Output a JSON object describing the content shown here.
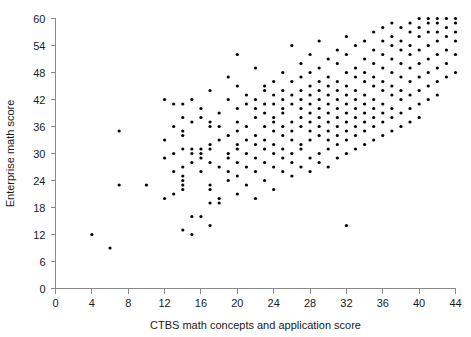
{
  "chart_data": {
    "type": "scatter",
    "title": "",
    "xlabel": "CTBS math concepts and application score",
    "ylabel": "Enterprise math score",
    "xlim": [
      0,
      44
    ],
    "ylim": [
      0,
      60
    ],
    "xticks": [
      0,
      4,
      8,
      12,
      16,
      20,
      24,
      28,
      32,
      36,
      40,
      44
    ],
    "yticks": [
      0,
      6,
      12,
      18,
      24,
      30,
      36,
      42,
      48,
      54,
      60
    ],
    "grid": false,
    "legend": null,
    "marker": {
      "shape": "circle",
      "color": "#000000",
      "size": 3.2
    },
    "points": [
      [
        4,
        12
      ],
      [
        6,
        9
      ],
      [
        7,
        23
      ],
      [
        7,
        35
      ],
      [
        10,
        23
      ],
      [
        12,
        20
      ],
      [
        12,
        42
      ],
      [
        12,
        29
      ],
      [
        12,
        33
      ],
      [
        13,
        21
      ],
      [
        13,
        36
      ],
      [
        13,
        41
      ],
      [
        13,
        30
      ],
      [
        13,
        26
      ],
      [
        14,
        13
      ],
      [
        14,
        22
      ],
      [
        14,
        23
      ],
      [
        14,
        24
      ],
      [
        14,
        25
      ],
      [
        14,
        27
      ],
      [
        14,
        31
      ],
      [
        14,
        34
      ],
      [
        14,
        35
      ],
      [
        14,
        38
      ],
      [
        14,
        41
      ],
      [
        15,
        12
      ],
      [
        15,
        16
      ],
      [
        15,
        28
      ],
      [
        15,
        30
      ],
      [
        15,
        31
      ],
      [
        15,
        37
      ],
      [
        15,
        42
      ],
      [
        16,
        16
      ],
      [
        16,
        26
      ],
      [
        16,
        29
      ],
      [
        16,
        30
      ],
      [
        16,
        31
      ],
      [
        16,
        38
      ],
      [
        16,
        40
      ],
      [
        17,
        14
      ],
      [
        17,
        19
      ],
      [
        17,
        22
      ],
      [
        17,
        23
      ],
      [
        17,
        28
      ],
      [
        17,
        31
      ],
      [
        17,
        32
      ],
      [
        17,
        36
      ],
      [
        17,
        37
      ],
      [
        17,
        44
      ],
      [
        18,
        19
      ],
      [
        18,
        20
      ],
      [
        18,
        27
      ],
      [
        18,
        33
      ],
      [
        18,
        36
      ],
      [
        18,
        39
      ],
      [
        19,
        24
      ],
      [
        19,
        26
      ],
      [
        19,
        29
      ],
      [
        19,
        30
      ],
      [
        19,
        34
      ],
      [
        19,
        42
      ],
      [
        19,
        47
      ],
      [
        20,
        21
      ],
      [
        20,
        25
      ],
      [
        20,
        28
      ],
      [
        20,
        31
      ],
      [
        20,
        32
      ],
      [
        20,
        35
      ],
      [
        20,
        37
      ],
      [
        20,
        40
      ],
      [
        20,
        45
      ],
      [
        20,
        52
      ],
      [
        21,
        23
      ],
      [
        21,
        27
      ],
      [
        21,
        30
      ],
      [
        21,
        33
      ],
      [
        21,
        36
      ],
      [
        21,
        41
      ],
      [
        21,
        43
      ],
      [
        22,
        20
      ],
      [
        22,
        26
      ],
      [
        22,
        29
      ],
      [
        22,
        32
      ],
      [
        22,
        34
      ],
      [
        22,
        38
      ],
      [
        22,
        40
      ],
      [
        22,
        42
      ],
      [
        22,
        49
      ],
      [
        23,
        24
      ],
      [
        23,
        28
      ],
      [
        23,
        31
      ],
      [
        23,
        33
      ],
      [
        23,
        36
      ],
      [
        23,
        39
      ],
      [
        23,
        41
      ],
      [
        23,
        44
      ],
      [
        23,
        45
      ],
      [
        24,
        22
      ],
      [
        24,
        27
      ],
      [
        24,
        30
      ],
      [
        24,
        32
      ],
      [
        24,
        35
      ],
      [
        24,
        37
      ],
      [
        24,
        38
      ],
      [
        24,
        41
      ],
      [
        24,
        43
      ],
      [
        24,
        46
      ],
      [
        25,
        26
      ],
      [
        25,
        29
      ],
      [
        25,
        31
      ],
      [
        25,
        34
      ],
      [
        25,
        36
      ],
      [
        25,
        39
      ],
      [
        25,
        40
      ],
      [
        25,
        42
      ],
      [
        25,
        44
      ],
      [
        25,
        48
      ],
      [
        26,
        25
      ],
      [
        26,
        28
      ],
      [
        26,
        30
      ],
      [
        26,
        33
      ],
      [
        26,
        35
      ],
      [
        26,
        37
      ],
      [
        26,
        41
      ],
      [
        26,
        43
      ],
      [
        26,
        46
      ],
      [
        26,
        54
      ],
      [
        27,
        27
      ],
      [
        27,
        31
      ],
      [
        27,
        32
      ],
      [
        27,
        36
      ],
      [
        27,
        38
      ],
      [
        27,
        40
      ],
      [
        27,
        42
      ],
      [
        27,
        44
      ],
      [
        27,
        47
      ],
      [
        27,
        50
      ],
      [
        28,
        26
      ],
      [
        28,
        29
      ],
      [
        28,
        33
      ],
      [
        28,
        35
      ],
      [
        28,
        37
      ],
      [
        28,
        39
      ],
      [
        28,
        41
      ],
      [
        28,
        43
      ],
      [
        28,
        45
      ],
      [
        28,
        48
      ],
      [
        28,
        52
      ],
      [
        29,
        28
      ],
      [
        29,
        30
      ],
      [
        29,
        34
      ],
      [
        29,
        36
      ],
      [
        29,
        38
      ],
      [
        29,
        40
      ],
      [
        29,
        42
      ],
      [
        29,
        44
      ],
      [
        29,
        46
      ],
      [
        29,
        49
      ],
      [
        29,
        55
      ],
      [
        30,
        27
      ],
      [
        30,
        31
      ],
      [
        30,
        33
      ],
      [
        30,
        35
      ],
      [
        30,
        37
      ],
      [
        30,
        39
      ],
      [
        30,
        41
      ],
      [
        30,
        43
      ],
      [
        30,
        45
      ],
      [
        30,
        47
      ],
      [
        30,
        51
      ],
      [
        31,
        29
      ],
      [
        31,
        32
      ],
      [
        31,
        34
      ],
      [
        31,
        36
      ],
      [
        31,
        38
      ],
      [
        31,
        40
      ],
      [
        31,
        42
      ],
      [
        31,
        44
      ],
      [
        31,
        46
      ],
      [
        31,
        50
      ],
      [
        31,
        53
      ],
      [
        32,
        14
      ],
      [
        32,
        30
      ],
      [
        32,
        33
      ],
      [
        32,
        35
      ],
      [
        32,
        37
      ],
      [
        32,
        39
      ],
      [
        32,
        41
      ],
      [
        32,
        43
      ],
      [
        32,
        45
      ],
      [
        32,
        48
      ],
      [
        32,
        52
      ],
      [
        32,
        56
      ],
      [
        33,
        31
      ],
      [
        33,
        34
      ],
      [
        33,
        36
      ],
      [
        33,
        38
      ],
      [
        33,
        40
      ],
      [
        33,
        42
      ],
      [
        33,
        44
      ],
      [
        33,
        47
      ],
      [
        33,
        49
      ],
      [
        33,
        54
      ],
      [
        34,
        32
      ],
      [
        34,
        35
      ],
      [
        34,
        37
      ],
      [
        34,
        39
      ],
      [
        34,
        41
      ],
      [
        34,
        43
      ],
      [
        34,
        46
      ],
      [
        34,
        48
      ],
      [
        34,
        51
      ],
      [
        34,
        55
      ],
      [
        35,
        33
      ],
      [
        35,
        36
      ],
      [
        35,
        38
      ],
      [
        35,
        40
      ],
      [
        35,
        42
      ],
      [
        35,
        45
      ],
      [
        35,
        47
      ],
      [
        35,
        50
      ],
      [
        35,
        53
      ],
      [
        35,
        57
      ],
      [
        36,
        34
      ],
      [
        36,
        37
      ],
      [
        36,
        39
      ],
      [
        36,
        41
      ],
      [
        36,
        44
      ],
      [
        36,
        46
      ],
      [
        36,
        49
      ],
      [
        36,
        52
      ],
      [
        36,
        55
      ],
      [
        36,
        58
      ],
      [
        37,
        35
      ],
      [
        37,
        38
      ],
      [
        37,
        40
      ],
      [
        37,
        43
      ],
      [
        37,
        45
      ],
      [
        37,
        48
      ],
      [
        37,
        51
      ],
      [
        37,
        54
      ],
      [
        37,
        56
      ],
      [
        37,
        59
      ],
      [
        38,
        36
      ],
      [
        38,
        39
      ],
      [
        38,
        42
      ],
      [
        38,
        44
      ],
      [
        38,
        47
      ],
      [
        38,
        50
      ],
      [
        38,
        53
      ],
      [
        38,
        55
      ],
      [
        38,
        58
      ],
      [
        39,
        37
      ],
      [
        39,
        40
      ],
      [
        39,
        43
      ],
      [
        39,
        46
      ],
      [
        39,
        49
      ],
      [
        39,
        52
      ],
      [
        39,
        54
      ],
      [
        39,
        57
      ],
      [
        39,
        59
      ],
      [
        40,
        38
      ],
      [
        40,
        41
      ],
      [
        40,
        44
      ],
      [
        40,
        47
      ],
      [
        40,
        50
      ],
      [
        40,
        53
      ],
      [
        40,
        56
      ],
      [
        40,
        58
      ],
      [
        40,
        60
      ],
      [
        41,
        42
      ],
      [
        41,
        45
      ],
      [
        41,
        48
      ],
      [
        41,
        51
      ],
      [
        41,
        54
      ],
      [
        41,
        57
      ],
      [
        41,
        59
      ],
      [
        41,
        60
      ],
      [
        42,
        43
      ],
      [
        42,
        46
      ],
      [
        42,
        49
      ],
      [
        42,
        52
      ],
      [
        42,
        55
      ],
      [
        42,
        57
      ],
      [
        42,
        59
      ],
      [
        42,
        60
      ],
      [
        43,
        47
      ],
      [
        43,
        50
      ],
      [
        43,
        53
      ],
      [
        43,
        56
      ],
      [
        43,
        58
      ],
      [
        43,
        60
      ],
      [
        44,
        48
      ],
      [
        44,
        52
      ],
      [
        44,
        55
      ],
      [
        44,
        57
      ],
      [
        44,
        59
      ],
      [
        44,
        60
      ]
    ]
  }
}
